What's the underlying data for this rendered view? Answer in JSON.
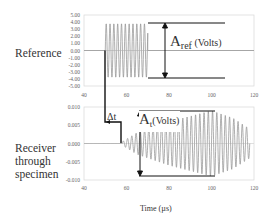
{
  "chart_data": [
    {
      "type": "line",
      "title": "Reference",
      "ylabel": "Reference",
      "xlabel": "",
      "xlim": [
        40,
        120
      ],
      "ylim": [
        -5.0,
        5.0
      ],
      "x_ticks": [
        "40",
        "60",
        "80",
        "100",
        "120"
      ],
      "y_ticks": [
        "5.00",
        "4.00",
        "3.00",
        "2.00",
        "1.00",
        "0.00",
        "-1.00",
        "-2.00",
        "-3.00",
        "-4.00",
        "-5.00"
      ],
      "grid": false,
      "series": [
        {
          "name": "Reference signal",
          "description": "Zero until t=50 µs, then constant-amplitude sinusoidal burst of ±3.8 V until about t=70 µs, then zero",
          "x": [
            40,
            50,
            50,
            70,
            70,
            120
          ],
          "envelope_amplitude": [
            0,
            0,
            3.8,
            3.8,
            0,
            0
          ]
        }
      ],
      "annotations": [
        {
          "text": "A",
          "subscript": "ref",
          "suffix": " (Volts)",
          "type": "amplitude-arrow",
          "from": 3.8,
          "to": -3.8
        }
      ]
    },
    {
      "type": "line",
      "title": "Receiver through specimen",
      "ylabel": "Receiver through specimen",
      "xlabel": "Time (µs)",
      "xlim": [
        40,
        120
      ],
      "ylim": [
        -0.01,
        0.01
      ],
      "x_ticks": [
        "40",
        "60",
        "80",
        "100",
        "120"
      ],
      "y_ticks": [
        "0.010",
        "0.005",
        "0.000",
        "-0.005",
        "-0.010"
      ],
      "grid": false,
      "series": [
        {
          "name": "Received signal",
          "description": "Starts near t=58 µs, amplitude grows to about ±0.009 near t=100 µs, then decays toward t=120 µs",
          "x": [
            58,
            65,
            70,
            80,
            90,
            100,
            110,
            118
          ],
          "envelope_amplitude": [
            0.0005,
            0.003,
            0.004,
            0.006,
            0.0075,
            0.009,
            0.007,
            0.004
          ]
        }
      ],
      "annotations": [
        {
          "text": "Δt",
          "type": "time-delay",
          "from": 50,
          "to": 58
        },
        {
          "text": "A",
          "subscript": "t",
          "suffix": "(Volts)",
          "type": "amplitude-arrow",
          "from": 0.009,
          "to": -0.009
        }
      ]
    }
  ],
  "labels": {
    "reference": "Reference",
    "receiver_line1": "Receiver",
    "receiver_line2": "through",
    "receiver_line3": "specimen",
    "time_axis": "Time (µs)",
    "aref_main": "A",
    "aref_sub": "ref",
    "aref_unit": " (Volts)",
    "at_main": "A",
    "at_sub": "t",
    "at_unit": "(Volts)",
    "delta_t": "Δt"
  },
  "ticks": {
    "top_y": [
      "5.00",
      "4.00",
      "3.00",
      "2.00",
      "1.00",
      "0.00",
      "-1.00",
      "-2.00",
      "-3.00",
      "-4.00",
      "-5.00"
    ],
    "bottom_y": [
      "0.010",
      "0.005",
      "0.000",
      "-0.005",
      "-0.010"
    ],
    "x": [
      "40",
      "60",
      "80",
      "100",
      "120"
    ]
  },
  "colors": {
    "signal": "#9a9a9a",
    "annotation": "#111111",
    "frame": "#d9d9d9"
  }
}
